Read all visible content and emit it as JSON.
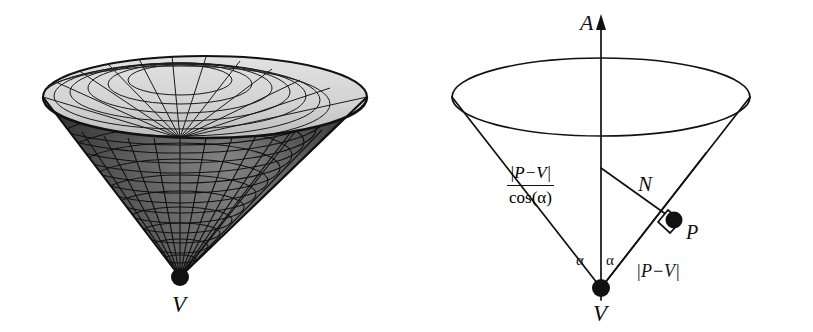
{
  "figure": {
    "background_color": "#ffffff",
    "ink_color": "#111111",
    "panels": [
      {
        "id": "left",
        "kind": "rendered-3d-mesh-cone",
        "caption": "V",
        "description": "Shaded wireframe mesh of an inverted circular cone seen from above, opening upward, apex at bottom",
        "mesh": {
          "radial_lines": 24,
          "ring_lines": 14,
          "inside_fill": "#d8d8d8",
          "outside_fill": "#6e6e6e",
          "line_color": "#111111"
        },
        "apex_dot": {
          "label": "V"
        }
      },
      {
        "id": "right",
        "kind": "schematic-cone-diagram",
        "axis_label": "A",
        "vertex_label": "V",
        "point_label": "P",
        "normal_label": "N",
        "angle_label": "α",
        "angle_label_left": "α",
        "angle_label_right": "α",
        "slant_label": {
          "numerator": "|P−V|",
          "denominator": "cos(α)"
        },
        "distance_label": "|P−V|",
        "right_angle_marker": "right-angle-square"
      }
    ]
  }
}
